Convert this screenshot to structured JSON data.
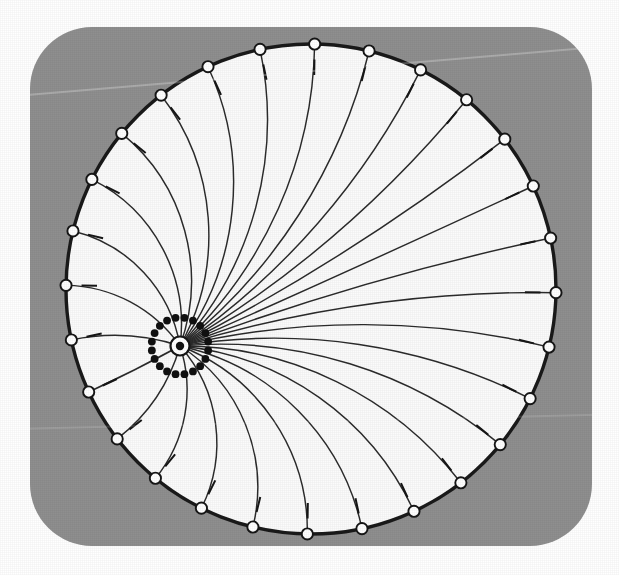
{
  "figure": {
    "panel": {
      "x": 30,
      "y": 27,
      "width": 562,
      "height": 519,
      "corner_radius": 62,
      "fill": "#8f8f8f"
    },
    "canvas": {
      "width": 619,
      "height": 575,
      "background": "#ffffff"
    }
  },
  "colors": {
    "background": "#ffffff",
    "panel_gray": "#8f8f8f",
    "disk_fill": "#fbfbfb",
    "boundary_stroke": "#1a1a1a",
    "geodesic_stroke": "#2b2b2b",
    "marker_fill": "#ffffff",
    "marker_stroke": "#161616",
    "dot_fill": "#111111",
    "right_angle_stroke": "#161616"
  },
  "chart_data": {
    "type": "scatter",
    "xlabel": "",
    "ylabel": "",
    "boundary_circle": {
      "cx": 311,
      "cy": 289,
      "r": 245,
      "stroke_width": 3.4
    },
    "hub": {
      "cx": 180,
      "cy": 346,
      "outer_r": 9.5,
      "inner_r": 4.2,
      "stroke_width": 2.2
    },
    "dot_ring": {
      "count": 20,
      "radius": 28.5,
      "dot_radius": 3.9,
      "start_angle_deg": -99
    },
    "geodesic_count": 28,
    "first_endpoint_angle_deg": -102,
    "angle_step_deg": 12.857,
    "endpoint_marker_radius": 5.6,
    "right_angle_size": 15.5,
    "straight_geodesic_index": 3
  },
  "legend": {
    "visible": false,
    "entries": []
  },
  "annotations": []
}
